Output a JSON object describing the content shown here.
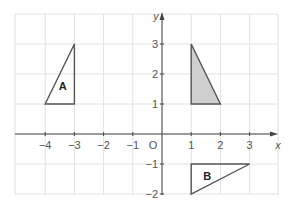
{
  "diagram": {
    "type": "coordinate-grid",
    "axes": {
      "x_label": "x",
      "y_label": "y",
      "origin_label": "O",
      "x_range": [
        -5,
        4
      ],
      "y_range": [
        -2,
        4
      ],
      "x_ticks": [
        {
          "value": -4,
          "label": "−4"
        },
        {
          "value": -3,
          "label": "−3"
        },
        {
          "value": -2,
          "label": "−2"
        },
        {
          "value": -1,
          "label": "−1"
        },
        {
          "value": 1,
          "label": "1"
        },
        {
          "value": 2,
          "label": "2"
        },
        {
          "value": 3,
          "label": "3"
        }
      ],
      "y_ticks": [
        {
          "value": 3,
          "label": "3"
        },
        {
          "value": 2,
          "label": "2"
        },
        {
          "value": 1,
          "label": "1"
        },
        {
          "value": -1,
          "label": "−1"
        },
        {
          "value": -2,
          "label": "−2"
        }
      ]
    },
    "shapes": [
      {
        "name": "A",
        "label": "A",
        "vertices": [
          [
            -4,
            1
          ],
          [
            -3,
            1
          ],
          [
            -3,
            3
          ]
        ],
        "fill": "none",
        "label_pos": [
          -3.4,
          1.6
        ]
      },
      {
        "name": "shaded",
        "label": "",
        "vertices": [
          [
            1,
            1
          ],
          [
            1,
            3
          ],
          [
            2,
            1
          ]
        ],
        "fill": "#cfcfcf",
        "label_pos": null
      },
      {
        "name": "B",
        "label": "B",
        "vertices": [
          [
            1,
            -1
          ],
          [
            3,
            -1
          ],
          [
            1,
            -2
          ]
        ],
        "fill": "none",
        "label_pos": [
          1.55,
          -1.4
        ]
      }
    ],
    "colors": {
      "grid": "#e2e2e2",
      "axis": "#444444",
      "shape_stroke": "#555555",
      "shaded_fill": "#cfcfcf"
    }
  }
}
